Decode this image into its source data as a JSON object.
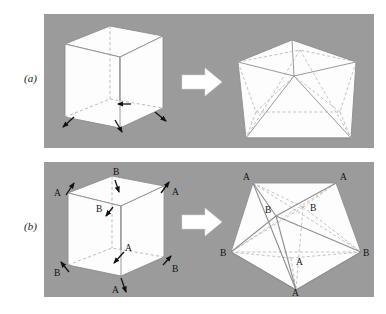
{
  "figure": {
    "type": "scientific-diagram",
    "width": 386,
    "height": 314,
    "background_color": "#ffffff",
    "panel_background_color": "#9b9b9b",
    "shape_fill_color": "#fdfdfd",
    "solid_edge_color": "#8f8f8f",
    "hidden_edge_color": "#b0b0b0",
    "arrow_color": "#ffffff",
    "marker_color": "#111111",
    "label_color": "#111111"
  },
  "panels": [
    {
      "id": "panel-a",
      "label": "(a)",
      "rect": {
        "x": 44,
        "y": 14,
        "width": 330,
        "height": 134
      },
      "left_shape": "cube",
      "right_shape": "icosahedron",
      "transform_arrow": "right-block-arrow",
      "vertex_labels": []
    },
    {
      "id": "panel-b",
      "label": "(b)",
      "rect": {
        "x": 44,
        "y": 162,
        "width": 330,
        "height": 135
      },
      "left_shape": "cube",
      "right_shape": "icosahedron",
      "transform_arrow": "right-block-arrow",
      "vertex_labels": [
        "A",
        "B"
      ]
    }
  ],
  "panel_a": {
    "label": "(a)",
    "cube_markers": [
      {
        "name": "displacement-arrow-front-bottom-left"
      },
      {
        "name": "displacement-arrow-front-bottom-center"
      },
      {
        "name": "displacement-arrow-front-bottom-right"
      },
      {
        "name": "displacement-arrow-mid-center"
      }
    ]
  },
  "panel_b": {
    "label": "(b)",
    "cube_labels": [
      {
        "text": "A",
        "x": 54,
        "y": 194,
        "name": "cube-label-a-top-left"
      },
      {
        "text": "A",
        "x": 166,
        "y": 194,
        "name": "cube-label-a-top-right"
      },
      {
        "text": "B",
        "x": 113,
        "y": 175,
        "name": "cube-label-b-top-back"
      },
      {
        "text": "B",
        "x": 97,
        "y": 213,
        "name": "cube-label-b-mid-front"
      },
      {
        "text": "B",
        "x": 54,
        "y": 276,
        "name": "cube-label-b-bottom-left"
      },
      {
        "text": "B",
        "x": 166,
        "y": 276,
        "name": "cube-label-b-bottom-right"
      },
      {
        "text": "A",
        "x": 125,
        "y": 253,
        "name": "cube-label-a-bottom-back"
      },
      {
        "text": "A",
        "x": 112,
        "y": 291,
        "name": "cube-label-a-bottom-front"
      }
    ],
    "polyhedron_labels": [
      {
        "text": "A",
        "x": 245,
        "y": 180,
        "name": "poly-label-a-top-left"
      },
      {
        "text": "A",
        "x": 341,
        "y": 180,
        "name": "poly-label-a-top-right"
      },
      {
        "text": "B",
        "x": 268,
        "y": 211,
        "name": "poly-label-b-upper-left"
      },
      {
        "text": "B",
        "x": 310,
        "y": 209,
        "name": "poly-label-b-upper-right"
      },
      {
        "text": "B",
        "x": 223,
        "y": 255,
        "name": "poly-label-b-left"
      },
      {
        "text": "B",
        "x": 360,
        "y": 255,
        "name": "poly-label-b-right"
      },
      {
        "text": "A",
        "x": 297,
        "y": 263,
        "name": "poly-label-a-center"
      },
      {
        "text": "A",
        "x": 290,
        "y": 293,
        "name": "poly-label-a-bottom"
      }
    ],
    "cube_markers": [
      {
        "name": "displacement-arrow-a-top-left"
      },
      {
        "name": "displacement-arrow-a-top-right"
      },
      {
        "name": "displacement-arrow-b-top-back"
      },
      {
        "name": "displacement-arrow-b-mid-front"
      },
      {
        "name": "displacement-arrow-b-bottom-left"
      },
      {
        "name": "displacement-arrow-b-bottom-right"
      },
      {
        "name": "displacement-arrow-a-bottom-back"
      },
      {
        "name": "displacement-arrow-a-bottom-front"
      }
    ]
  }
}
